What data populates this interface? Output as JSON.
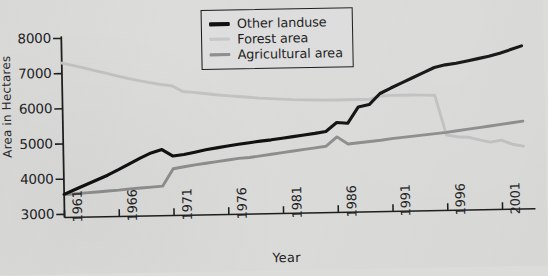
{
  "chart_data": {
    "type": "line",
    "title": "",
    "xlabel": "Year",
    "ylabel": "Area in Hectares",
    "xlim": [
      1961,
      2004
    ],
    "ylim": [
      3000,
      8300
    ],
    "yticks": [
      3000,
      4000,
      5000,
      6000,
      7000,
      8000
    ],
    "xticks": [
      1961,
      1966,
      1971,
      1976,
      1981,
      1986,
      1991,
      1996,
      2001
    ],
    "grid": false,
    "legend_position": "top-right",
    "x": [
      1961,
      1962,
      1963,
      1964,
      1965,
      1966,
      1967,
      1968,
      1969,
      1970,
      1971,
      1972,
      1973,
      1974,
      1975,
      1976,
      1977,
      1978,
      1979,
      1980,
      1981,
      1982,
      1983,
      1984,
      1985,
      1986,
      1987,
      1988,
      1989,
      1990,
      1991,
      1992,
      1993,
      1994,
      1995,
      1996,
      1997,
      1998,
      1999,
      2000,
      2001,
      2002,
      2003
    ],
    "series": [
      {
        "name": "Other landuse",
        "color": "#111111",
        "values": [
          3570,
          3700,
          3830,
          3960,
          4090,
          4240,
          4400,
          4560,
          4700,
          4790,
          4600,
          4640,
          4700,
          4760,
          4810,
          4860,
          4900,
          4940,
          4980,
          5010,
          5050,
          5090,
          5130,
          5170,
          5220,
          5470,
          5440,
          5900,
          5960,
          6270,
          6420,
          6560,
          6700,
          6840,
          6980,
          7050,
          7090,
          7150,
          7210,
          7270,
          7350,
          7450,
          7550
        ]
      },
      {
        "name": "Forest area",
        "color": "#c3c3c3",
        "values": [
          7300,
          7230,
          7150,
          7070,
          6990,
          6910,
          6830,
          6760,
          6700,
          6640,
          6600,
          6430,
          6400,
          6360,
          6320,
          6290,
          6260,
          6230,
          6200,
          6180,
          6160,
          6140,
          6130,
          6120,
          6110,
          6110,
          6110,
          6110,
          6110,
          6200,
          6210,
          6210,
          6210,
          6200,
          6190,
          5060,
          5000,
          4980,
          4900,
          4830,
          4880,
          4760,
          4700
        ]
      },
      {
        "name": "Agricultural area",
        "color": "#8e8e8e",
        "values": [
          3560,
          3580,
          3600,
          3620,
          3640,
          3660,
          3690,
          3710,
          3730,
          3750,
          4240,
          4290,
          4340,
          4380,
          4420,
          4460,
          4500,
          4520,
          4560,
          4600,
          4640,
          4680,
          4720,
          4760,
          4800,
          5060,
          4850,
          4880,
          4910,
          4940,
          4980,
          5010,
          5040,
          5070,
          5100,
          5130,
          5170,
          5210,
          5250,
          5290,
          5330,
          5370,
          5410
        ]
      }
    ]
  },
  "legend": {
    "items": [
      {
        "label": "Other landuse"
      },
      {
        "label": "Forest area"
      },
      {
        "label": "Agricultural area"
      }
    ]
  },
  "axes": {
    "y_title": "Area in Hectares",
    "x_title": "Year",
    "y_tick_labels": [
      "8000",
      "7000",
      "6000",
      "5000",
      "4000",
      "3000"
    ],
    "x_tick_labels": [
      "1961",
      "1966",
      "1971",
      "1976",
      "1981",
      "1986",
      "1991",
      "1996",
      "2001"
    ]
  },
  "colors": {
    "background": "#dcdcdb",
    "axis": "#1e1e1e",
    "other_landuse": "#111111",
    "forest_area": "#c3c3c3",
    "agricultural_area": "#8e8e8e"
  }
}
